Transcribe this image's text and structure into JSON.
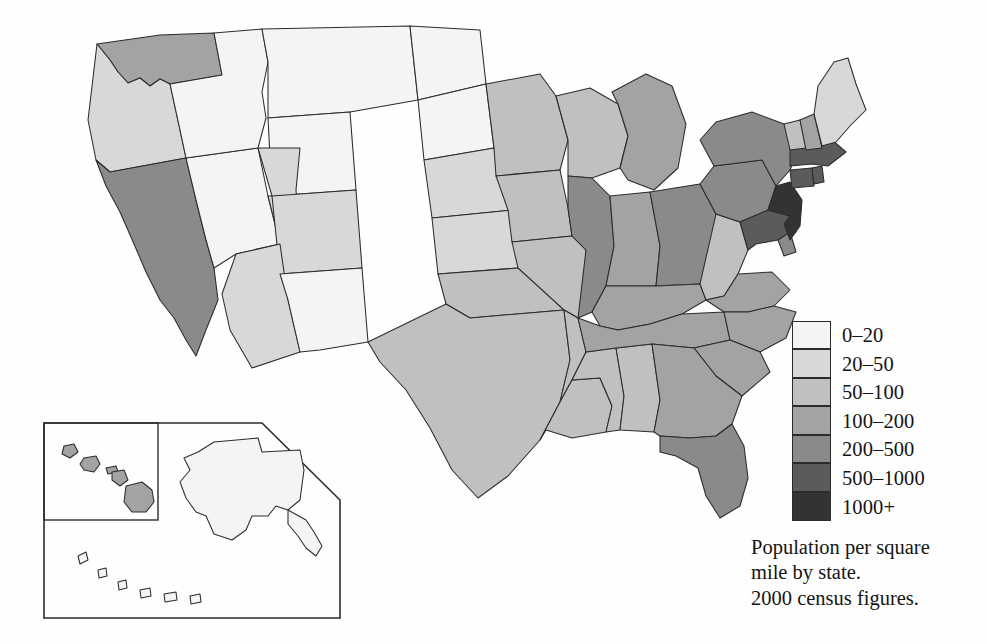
{
  "figure": {
    "kind": "choropleth-map",
    "region": "United States",
    "background_color": "#fefefe",
    "outline_color": "#2b2b2b"
  },
  "caption": {
    "line1": "Population per square",
    "line2": "mile by state.",
    "line3": "2000 census figures."
  },
  "legend": {
    "title": "",
    "bins": [
      {
        "label": "0–20",
        "color": "#f4f4f4"
      },
      {
        "label": "20–50",
        "color": "#d8d8d8"
      },
      {
        "label": "50–100",
        "color": "#c0c0c0"
      },
      {
        "label": "100–200",
        "color": "#a3a3a3"
      },
      {
        "label": "200–500",
        "color": "#8a8a8a"
      },
      {
        "label": "500–1000",
        "color": "#5b5b5b"
      },
      {
        "label": "1000+",
        "color": "#333333"
      }
    ]
  },
  "insets": {
    "alaska_label": "Alaska",
    "hawaii_label": "Hawaii"
  },
  "chart_data": {
    "type": "heatmap",
    "title": "Population per square mile by state. 2000 census figures.",
    "xlabel": "",
    "ylabel": "",
    "legend_position": "right",
    "categories": [
      "Alabama",
      "Alaska",
      "Arizona",
      "Arkansas",
      "California",
      "Colorado",
      "Connecticut",
      "Delaware",
      "Florida",
      "Georgia",
      "Hawaii",
      "Idaho",
      "Illinois",
      "Indiana",
      "Iowa",
      "Kansas",
      "Kentucky",
      "Louisiana",
      "Maine",
      "Maryland",
      "Massachusetts",
      "Michigan",
      "Minnesota",
      "Mississippi",
      "Missouri",
      "Montana",
      "Nebraska",
      "Nevada",
      "New Hampshire",
      "New Jersey",
      "New Mexico",
      "New York",
      "North Carolina",
      "North Dakota",
      "Ohio",
      "Oklahoma",
      "Oregon",
      "Pennsylvania",
      "Rhode Island",
      "South Carolina",
      "South Dakota",
      "Tennessee",
      "Texas",
      "Utah",
      "Vermont",
      "Virginia",
      "Washington",
      "West Virginia",
      "Wisconsin",
      "Wyoming"
    ],
    "values": [
      "50–100",
      "0–20",
      "20–50",
      "50–100",
      "200–500",
      "20–50",
      "500–1000",
      "200–500",
      "200–500",
      "100–200",
      "100–200",
      "0–20",
      "200–500",
      "100–200",
      "50–100",
      "20–50",
      "100–200",
      "50–100",
      "20–50",
      "500–1000",
      "500–1000",
      "100–200",
      "50–100",
      "50–100",
      "50–100",
      "0–20",
      "20–50",
      "0–20",
      "100–200",
      "1000+",
      "0–20",
      "200–500",
      "100–200",
      "0–20",
      "200–500",
      "50–100",
      "20–50",
      "200–500",
      "500–1000",
      "100–200",
      "0–20",
      "100–200",
      "50–100",
      "20–50",
      "50–100",
      "100–200",
      "100–200",
      "50–100",
      "50–100",
      "0–20"
    ],
    "bin_labels": [
      "0–20",
      "20–50",
      "50–100",
      "100–200",
      "200–500",
      "500–1000",
      "1000+"
    ],
    "bin_colors": [
      "#f4f4f4",
      "#d8d8d8",
      "#c0c0c0",
      "#a3a3a3",
      "#8a8a8a",
      "#5b5b5b",
      "#333333"
    ],
    "units": "people per square mile",
    "source_year": "2000"
  }
}
